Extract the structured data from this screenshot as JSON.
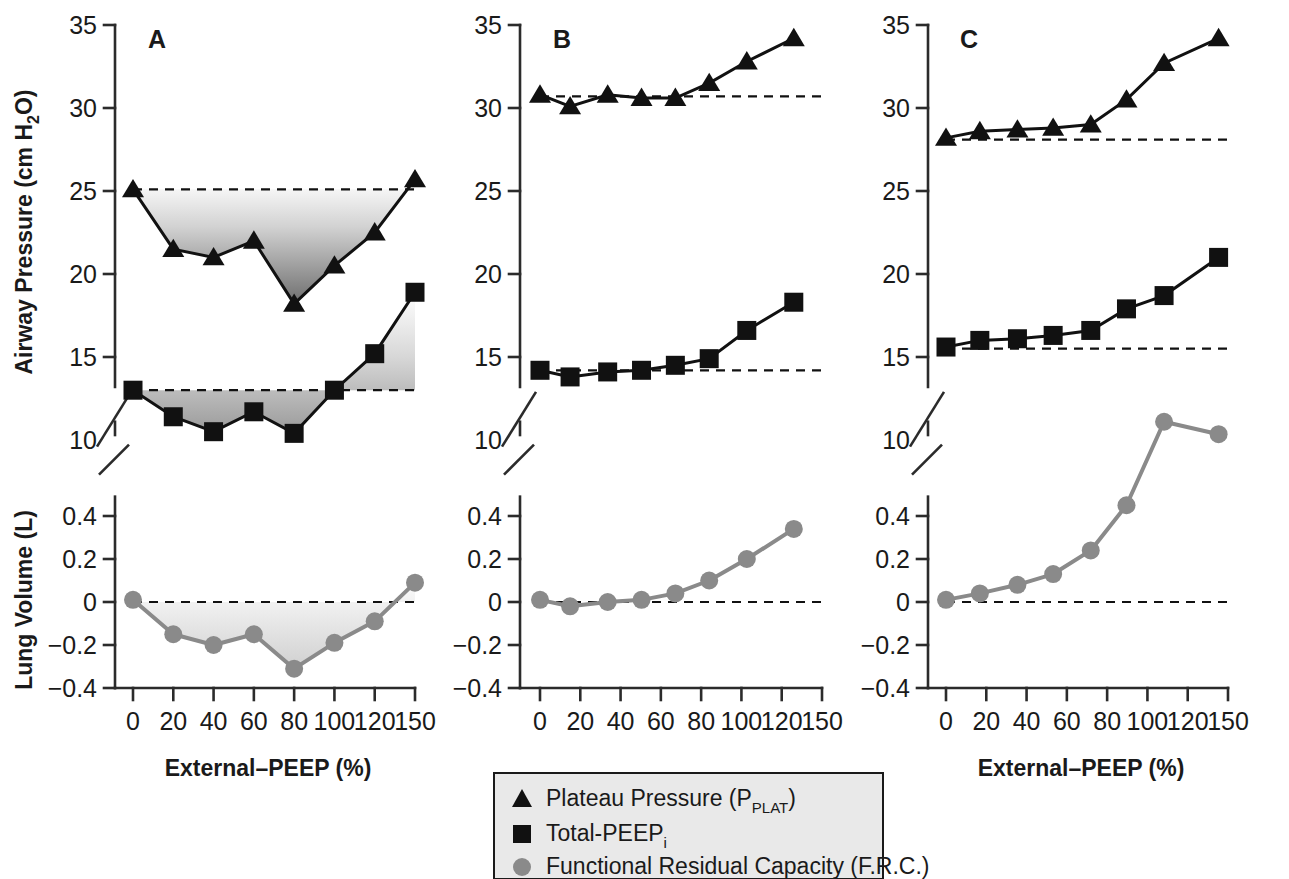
{
  "figure": {
    "axis_titles": {
      "y_pressure": "Airway Pressure (cm H",
      "y_pressure_sub": "2",
      "y_pressure_end": "O)",
      "y_volume": "Lung Volume (L)",
      "x_axis": "External–PEEP (%)"
    },
    "panels": [
      {
        "label": "A"
      },
      {
        "label": "B"
      },
      {
        "label": "C"
      }
    ],
    "pressure_ticks": [
      "35",
      "30",
      "25",
      "20",
      "15",
      "10"
    ],
    "volume_ticks": [
      "0.4",
      "0.2",
      "0",
      "−0.2",
      "−0.4"
    ],
    "x_ticks": [
      "0",
      "20",
      "40",
      "60",
      "80",
      "100",
      "120",
      "150"
    ],
    "legend": {
      "items": [
        {
          "marker": "triangle-marker",
          "label": "Plateau Pressure (P",
          "sub": "PLAT",
          "tail": ")"
        },
        {
          "marker": "square-marker",
          "label": "Total-PEEP",
          "sub": "i",
          "tail": ""
        },
        {
          "marker": "circle-marker",
          "label": "Functional Residual Capacity (F.R.C.)",
          "sub": "",
          "tail": ""
        }
      ]
    },
    "colors": {
      "ink": "#111111",
      "frc_gray": "#8a8a8a",
      "legend_bg": "#e9e9e9",
      "shade_dark": "#6e6e6e",
      "shade_light_dark": "#b9b9b9"
    }
  },
  "chart_data": [
    {
      "type": "line",
      "panel": "A",
      "title": "A",
      "xlabel": "External–PEEP (%)",
      "ylabel": "Airway Pressure (cm H2O)",
      "ylim": [
        10,
        35
      ],
      "categories": [
        "0",
        "20",
        "40",
        "60",
        "80",
        "100",
        "120",
        "150"
      ],
      "grid": false,
      "legend": "below",
      "reference_lines": [
        {
          "series": "Plateau Pressure (P_PLAT)",
          "value": 25.1
        },
        {
          "series": "Total-PEEP_i",
          "value": 13.0
        }
      ],
      "shaded_between_reference_and_curve": true,
      "series": [
        {
          "name": "Plateau Pressure (P_PLAT)",
          "marker": "triangle",
          "values": [
            25.1,
            21.5,
            21.0,
            22.0,
            18.2,
            20.5,
            22.5,
            25.7
          ]
        },
        {
          "name": "Total-PEEP_i",
          "marker": "square",
          "values": [
            13.0,
            11.4,
            10.5,
            11.7,
            10.4,
            13.0,
            15.2,
            18.9
          ]
        }
      ]
    },
    {
      "type": "line",
      "panel": "A-lower",
      "title": "A",
      "xlabel": "External–PEEP (%)",
      "ylabel": "Lung Volume (L)",
      "ylim": [
        -0.4,
        0.5
      ],
      "categories": [
        "0",
        "20",
        "40",
        "60",
        "80",
        "100",
        "120",
        "150"
      ],
      "grid": false,
      "reference_lines": [
        {
          "series": "F.R.C.",
          "value": 0
        }
      ],
      "shaded_between_reference_and_curve": true,
      "series": [
        {
          "name": "Functional Residual Capacity (F.R.C.)",
          "marker": "circle",
          "values": [
            0.01,
            -0.15,
            -0.2,
            -0.15,
            -0.31,
            -0.19,
            -0.09,
            0.09
          ]
        }
      ]
    },
    {
      "type": "line",
      "panel": "B",
      "title": "B",
      "xlabel": "External–PEEP (%)",
      "ylabel": "Airway Pressure (cm H2O)",
      "ylim": [
        10,
        35
      ],
      "x": [
        0,
        16,
        36,
        54,
        72,
        90,
        110,
        135
      ],
      "x_ticks": [
        0,
        20,
        40,
        60,
        80,
        100,
        120,
        150
      ],
      "grid": false,
      "reference_lines": [
        {
          "series": "Plateau Pressure (P_PLAT)",
          "value": 30.7
        },
        {
          "series": "Total-PEEP_i",
          "value": 14.2
        }
      ],
      "shaded_between_reference_and_curve": false,
      "series": [
        {
          "name": "Plateau Pressure (P_PLAT)",
          "marker": "triangle",
          "values": [
            30.8,
            30.1,
            30.8,
            30.6,
            30.6,
            31.5,
            32.8,
            34.2
          ]
        },
        {
          "name": "Total-PEEP_i",
          "marker": "square",
          "values": [
            14.2,
            13.8,
            14.1,
            14.2,
            14.5,
            14.9,
            16.6,
            18.3
          ]
        }
      ]
    },
    {
      "type": "line",
      "panel": "B-lower",
      "title": "B",
      "xlabel": "External–PEEP (%)",
      "ylabel": "Lung Volume (L)",
      "ylim": [
        -0.4,
        0.5
      ],
      "x": [
        0,
        16,
        36,
        54,
        72,
        90,
        110,
        135
      ],
      "grid": false,
      "reference_lines": [
        {
          "series": "F.R.C.",
          "value": 0
        }
      ],
      "shaded_between_reference_and_curve": false,
      "series": [
        {
          "name": "Functional Residual Capacity (F.R.C.)",
          "marker": "circle",
          "values": [
            0.01,
            -0.02,
            0.0,
            0.01,
            0.04,
            0.1,
            0.2,
            0.34
          ]
        }
      ]
    },
    {
      "type": "line",
      "panel": "C",
      "title": "C",
      "xlabel": "External–PEEP (%)",
      "ylabel": "Airway Pressure (cm H2O)",
      "ylim": [
        10,
        35
      ],
      "x": [
        0,
        18,
        38,
        57,
        77,
        96,
        116,
        145
      ],
      "x_ticks": [
        0,
        20,
        40,
        60,
        80,
        100,
        120,
        150
      ],
      "grid": false,
      "reference_lines": [
        {
          "series": "Plateau Pressure (P_PLAT)",
          "value": 28.1
        },
        {
          "series": "Total-PEEP_i",
          "value": 15.5
        }
      ],
      "shaded_between_reference_and_curve": false,
      "series": [
        {
          "name": "Plateau Pressure (P_PLAT)",
          "marker": "triangle",
          "values": [
            28.2,
            28.6,
            28.7,
            28.8,
            29.0,
            30.5,
            32.7,
            34.2
          ]
        },
        {
          "name": "Total-PEEP_i",
          "marker": "square",
          "values": [
            15.6,
            16.0,
            16.1,
            16.3,
            16.6,
            17.9,
            18.7,
            21.0
          ]
        }
      ]
    },
    {
      "type": "line",
      "panel": "C-lower",
      "title": "C",
      "xlabel": "External–PEEP (%)",
      "ylabel": "Lung Volume (L)",
      "ylim": [
        -0.4,
        0.5
      ],
      "x": [
        0,
        18,
        38,
        57,
        77,
        96,
        116,
        145
      ],
      "grid": false,
      "reference_lines": [
        {
          "series": "F.R.C.",
          "value": 0
        }
      ],
      "shaded_between_reference_and_curve": false,
      "series": [
        {
          "name": "Functional Residual Capacity (F.R.C.)",
          "marker": "circle",
          "values": [
            0.01,
            0.04,
            0.08,
            0.13,
            0.24,
            0.45,
            0.62,
            0.7
          ]
        }
      ]
    }
  ]
}
